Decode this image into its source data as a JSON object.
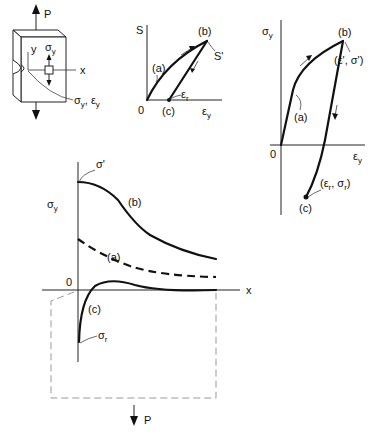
{
  "specimen": {
    "load_top": "P",
    "axis_y": "y",
    "axis_x": "x",
    "stress_symbol": "σ",
    "stress_sub": "y",
    "callout_main": "σ",
    "callout_sub1": "y",
    "callout_sep": ", ε",
    "callout_sub2": "y"
  },
  "ss_curve": {
    "y_axis": "S",
    "x_axis_main": "ε",
    "x_axis_sub": "y",
    "origin": "0",
    "point_a": "(a)",
    "point_b": "(b)",
    "point_c": "(c)",
    "peak_label": "S'",
    "residual_main": "ε",
    "residual_sub": "r"
  },
  "local_curve": {
    "y_axis_main": "σ",
    "y_axis_sub": "y",
    "x_axis_main": "ε",
    "x_axis_sub": "y",
    "origin": "0",
    "point_a": "(a)",
    "point_b": "(b)",
    "point_c": "(c)",
    "peak_coords": "(ε', σ')",
    "res_open": "(ε",
    "res_sub1": "r",
    "res_mid": ", σ",
    "res_sub2": "r",
    "res_close": ")"
  },
  "distribution": {
    "y_axis_main": "σ",
    "y_axis_sub": "y",
    "x_axis": "x",
    "origin": "0",
    "peak_label": "σ'",
    "curve_a": "(a)",
    "curve_b": "(b)",
    "curve_c": "(c)",
    "residual_main": "σ",
    "residual_sub": "r",
    "load_bottom": "P"
  }
}
